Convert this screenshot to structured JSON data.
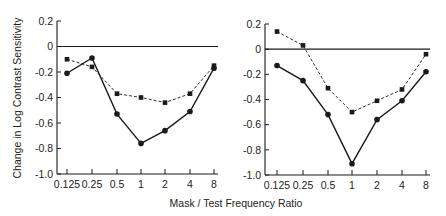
{
  "chart_data": [
    {
      "type": "line",
      "panel": "left",
      "title": "",
      "xlabel": "Mask / Test Frequency Ratio",
      "ylabel": "Change in Log Contrast Sensitivity",
      "categories": [
        "0.125",
        "0.25",
        "0.5",
        "1",
        "2",
        "4",
        "8"
      ],
      "ylim": [
        -1.0,
        0.2
      ],
      "yticks": [
        "0.2",
        "0",
        "-0.2",
        "-0.4",
        "-0.6",
        "-0.8",
        "-1.0"
      ],
      "grid": false,
      "reference_line": 0,
      "series": [
        {
          "name": "solid",
          "style": "solid",
          "marker": "circle",
          "values": [
            -0.21,
            -0.09,
            -0.53,
            -0.76,
            -0.66,
            -0.51,
            -0.17
          ]
        },
        {
          "name": "dashed",
          "style": "dashed",
          "marker": "square",
          "values": [
            -0.1,
            -0.16,
            -0.37,
            -0.4,
            -0.44,
            -0.37,
            -0.15
          ]
        }
      ]
    },
    {
      "type": "line",
      "panel": "right",
      "title": "",
      "xlabel": "Mask / Test Frequency Ratio",
      "ylabel": "",
      "categories": [
        "0.125",
        "0.25",
        "0.5",
        "1",
        "2",
        "4",
        "8"
      ],
      "ylim": [
        -1.0,
        0.2
      ],
      "yticks": [
        "0.2",
        "0",
        "-0.2",
        "-0.4",
        "-0.6",
        "-0.8",
        "-1.0"
      ],
      "grid": false,
      "reference_line": 0,
      "series": [
        {
          "name": "solid",
          "style": "solid",
          "marker": "circle",
          "values": [
            -0.13,
            -0.25,
            -0.52,
            -0.91,
            -0.56,
            -0.41,
            -0.18
          ]
        },
        {
          "name": "dashed",
          "style": "dashed",
          "marker": "square",
          "values": [
            0.14,
            0.03,
            -0.31,
            -0.5,
            -0.41,
            -0.32,
            -0.04
          ]
        }
      ]
    }
  ],
  "labels": {
    "ylabel": "Change in Log Contrast Sensitivity",
    "xlabel": "Mask / Test Frequency Ratio"
  }
}
